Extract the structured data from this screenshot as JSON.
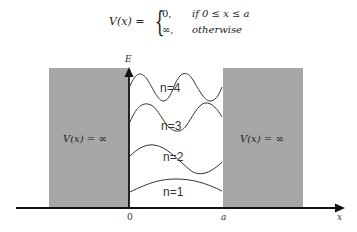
{
  "equation": {
    "lhs": "V(x) =",
    "cases": [
      {
        "value": "0,",
        "condition": "if 0 ≤ x ≤ a"
      },
      {
        "value": "∞,",
        "condition": "otherwise"
      }
    ]
  },
  "walls": {
    "left_label": "V(x) = ∞",
    "right_label": "V(x) = ∞",
    "color": "#a7a7a7"
  },
  "axes": {
    "y_label": "E",
    "x_label": "x",
    "origin_label": "0",
    "well_edge_label": "a"
  },
  "levels": [
    {
      "label": "n=4"
    },
    {
      "label": "n=3"
    },
    {
      "label": "n=2"
    },
    {
      "label": "n=1"
    }
  ]
}
